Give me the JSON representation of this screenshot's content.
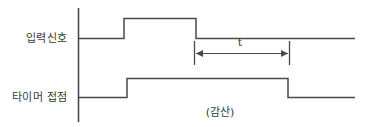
{
  "diagram": {
    "caption": "(감산)",
    "duration_label": "t",
    "line_color": "#4a4a4a",
    "text_color": "#3a3a3a",
    "background_color": "#ffffff",
    "waveforms": [
      {
        "id": "input-signal",
        "label": "입력신호",
        "baseline_y": 38,
        "pulse_top_y": 18,
        "pulse_start_x": 124,
        "pulse_end_x": 196,
        "line_start_x": 78,
        "line_end_x": 355
      },
      {
        "id": "timer-contact",
        "label": "타이머 접점",
        "baseline_y": 97,
        "pulse_top_y": 78,
        "pulse_start_x": 127,
        "pulse_end_x": 288,
        "line_start_x": 78,
        "line_end_x": 355
      }
    ],
    "axis": {
      "x": 78,
      "y_top": 8,
      "y_bottom": 122
    },
    "dimension": {
      "label": "t",
      "line_y": 53,
      "start_x": 194,
      "end_x": 289,
      "tick_top_y": 41,
      "tick_bottom_y": 65
    }
  }
}
